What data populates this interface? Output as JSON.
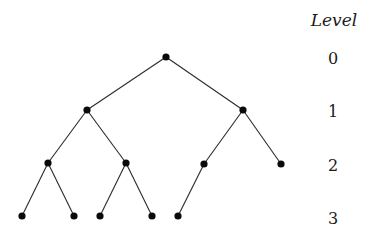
{
  "diagram": {
    "type": "binary-tree",
    "heading": "Level",
    "levels": [
      {
        "label": "0",
        "y": 57
      },
      {
        "label": "1",
        "y": 110
      },
      {
        "label": "2",
        "y": 164
      },
      {
        "label": "3",
        "y": 216
      }
    ],
    "nodes": [
      {
        "id": "n0",
        "level": 0,
        "x": 166,
        "y": 57
      },
      {
        "id": "n1",
        "level": 1,
        "x": 87,
        "y": 110
      },
      {
        "id": "n2",
        "level": 1,
        "x": 243,
        "y": 110
      },
      {
        "id": "n3",
        "level": 2,
        "x": 48,
        "y": 163
      },
      {
        "id": "n4",
        "level": 2,
        "x": 126,
        "y": 163
      },
      {
        "id": "n5",
        "level": 2,
        "x": 204,
        "y": 164
      },
      {
        "id": "n6",
        "level": 2,
        "x": 281,
        "y": 164
      },
      {
        "id": "n7",
        "level": 3,
        "x": 22,
        "y": 216
      },
      {
        "id": "n8",
        "level": 3,
        "x": 74,
        "y": 216
      },
      {
        "id": "n9",
        "level": 3,
        "x": 100,
        "y": 216
      },
      {
        "id": "n10",
        "level": 3,
        "x": 152,
        "y": 216
      },
      {
        "id": "n11",
        "level": 3,
        "x": 178,
        "y": 216
      }
    ],
    "edges": [
      [
        "n0",
        "n1"
      ],
      [
        "n0",
        "n2"
      ],
      [
        "n1",
        "n3"
      ],
      [
        "n1",
        "n4"
      ],
      [
        "n2",
        "n5"
      ],
      [
        "n2",
        "n6"
      ],
      [
        "n3",
        "n7"
      ],
      [
        "n3",
        "n8"
      ],
      [
        "n4",
        "n9"
      ],
      [
        "n4",
        "n10"
      ],
      [
        "n5",
        "n11"
      ]
    ],
    "colors": {
      "node": "#0a0a0a",
      "edge": "#2a2a2a",
      "text": "#1a1a1a",
      "background": "#ffffff"
    }
  }
}
